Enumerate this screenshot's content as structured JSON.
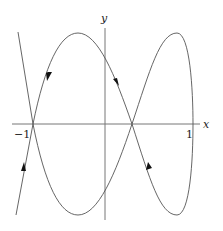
{
  "diagram": {
    "type": "phase-portrait",
    "axes": {
      "x_label": "x",
      "y_label": "y",
      "x_ticks": [
        "−1",
        "1"
      ]
    },
    "curves": [
      {
        "name": "left-branch",
        "description": "steep branch through (-1,0)"
      },
      {
        "name": "figure-eight",
        "description": "closed orbit with crossing between 0 and 1"
      }
    ],
    "arrows": [
      {
        "name": "arrow-upper-left",
        "direction": "down"
      },
      {
        "name": "arrow-upper-middle",
        "direction": "down"
      },
      {
        "name": "arrow-lower-left",
        "direction": "up"
      },
      {
        "name": "arrow-lower-right",
        "direction": "up"
      }
    ],
    "colors": {
      "curve": "#555555",
      "axis": "#777777",
      "arrow": "#111111"
    }
  }
}
